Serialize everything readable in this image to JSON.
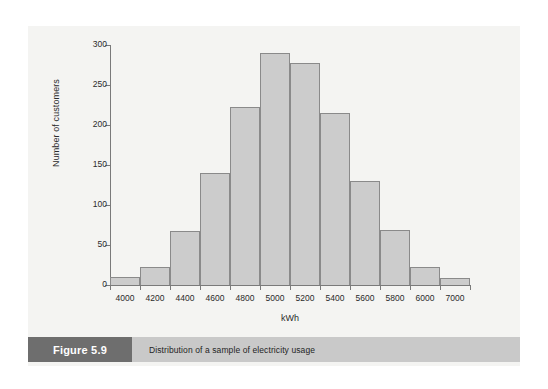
{
  "figure": {
    "caption_tag": "Figure 5.9",
    "caption_text": "Distribution of a sample of electricity usage"
  },
  "colors": {
    "page_background": "#ffffff",
    "panel_background": "#f4f4f2",
    "bar_fill": "#cccccc",
    "bar_stroke": "#8a8a8a",
    "axis": "#7a7a7a",
    "caption_tag_bg": "#6e6e6e",
    "caption_tag_text": "#ffffff",
    "caption_body_bg": "#c9c9c9",
    "caption_body_text": "#1f1f1f"
  },
  "chart_data": {
    "type": "bar",
    "title": "",
    "xlabel": "kWh",
    "ylabel": "Number of customers",
    "categories": [
      "4000",
      "4200",
      "4400",
      "4600",
      "4800",
      "5000",
      "5200",
      "5400",
      "5600",
      "5800",
      "6000",
      "7000"
    ],
    "values": [
      10,
      22,
      68,
      140,
      222,
      290,
      278,
      215,
      130,
      69,
      23,
      9
    ],
    "xtick_labels": [
      "4000",
      "4200",
      "4400",
      "4600",
      "4800",
      "5000",
      "5200",
      "5400",
      "5600",
      "5800",
      "6000",
      "7000"
    ],
    "ytick_labels": [
      "0",
      "50",
      "100",
      "150",
      "200",
      "250",
      "300"
    ],
    "ytick_values": [
      0,
      50,
      100,
      150,
      200,
      250,
      300
    ],
    "ylim": [
      0,
      300
    ],
    "grid": false,
    "legend": false,
    "legend_position": "none",
    "bar_gap": 0
  }
}
